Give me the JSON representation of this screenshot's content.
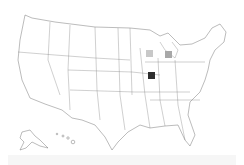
{
  "map": {
    "region": "United States",
    "markers": [
      {
        "state": "Wisconsin",
        "color": "#c8c8c8",
        "x": 146,
        "y": 50
      },
      {
        "state": "Michigan",
        "color": "#a8a8a8",
        "x": 165,
        "y": 51
      },
      {
        "state": "Illinois",
        "color": "#2e2e2e",
        "x": 148,
        "y": 72
      }
    ]
  }
}
